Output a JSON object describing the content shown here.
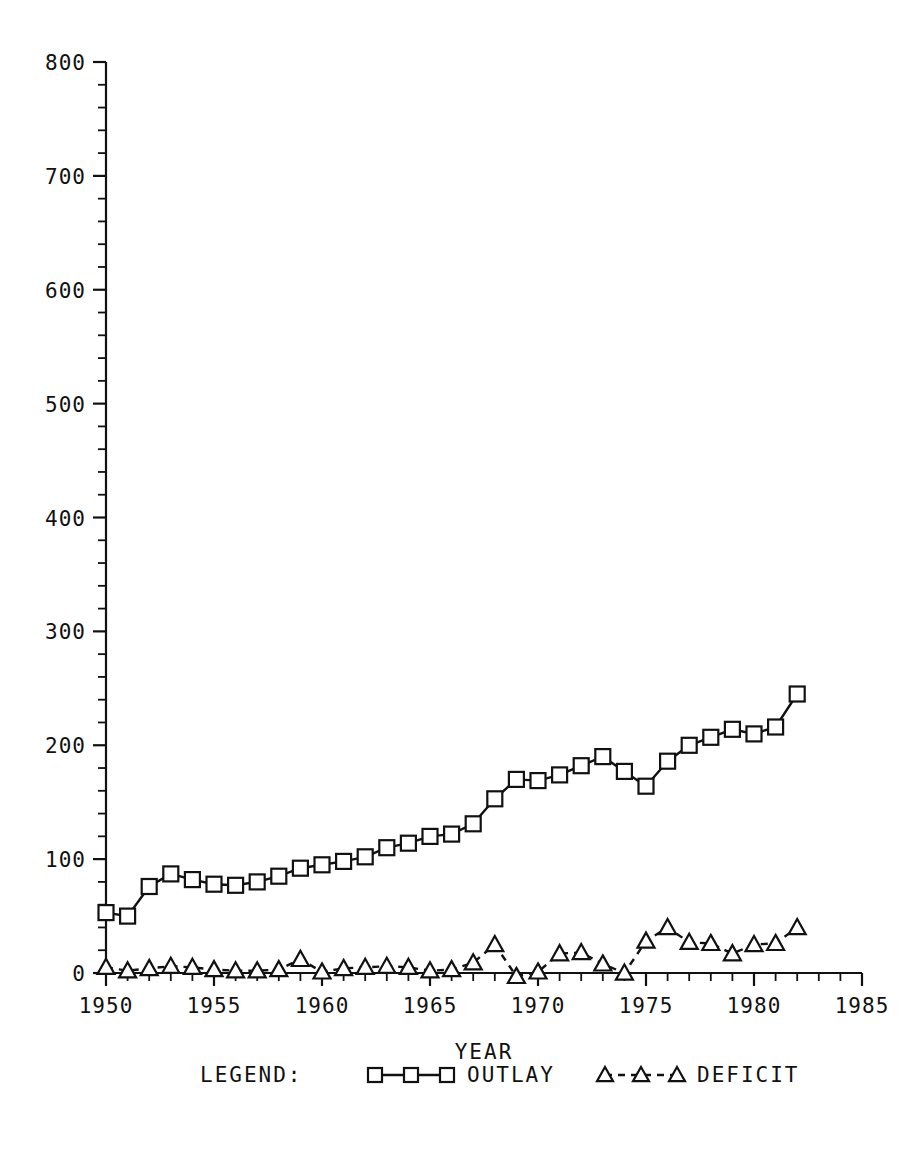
{
  "chart_data": {
    "type": "line",
    "title": "",
    "xlabel": "YEAR",
    "ylabel": "",
    "xlim": [
      1950,
      1985
    ],
    "ylim": [
      0,
      800
    ],
    "grid": false,
    "legend_position": "bottom",
    "legend_label": "LEGEND:",
    "x": [
      1950,
      1951,
      1952,
      1953,
      1954,
      1955,
      1956,
      1957,
      1958,
      1959,
      1960,
      1961,
      1962,
      1963,
      1964,
      1965,
      1966,
      1967,
      1968,
      1969,
      1970,
      1971,
      1972,
      1973,
      1974,
      1975,
      1976,
      1977,
      1978,
      1979,
      1980,
      1981,
      1982
    ],
    "xticks_major": [
      1950,
      1955,
      1960,
      1965,
      1970,
      1975,
      1980,
      1985
    ],
    "xticklabels": [
      "1950",
      "1955",
      "1960",
      "1965",
      "1970",
      "1975",
      "1980",
      "1985"
    ],
    "yticks_major": [
      0,
      100,
      200,
      300,
      400,
      500,
      600,
      700,
      800
    ],
    "yticklabels": [
      "0",
      "100",
      "200",
      "300",
      "400",
      "500",
      "600",
      "700",
      "800"
    ],
    "series": [
      {
        "name": "OUTLAY",
        "marker": "square",
        "linestyle": "solid",
        "color": "#111111",
        "values": [
          53,
          50,
          76,
          87,
          82,
          78,
          77,
          80,
          85,
          92,
          95,
          98,
          102,
          110,
          114,
          120,
          122,
          131,
          153,
          170,
          169,
          174,
          182,
          190,
          177,
          164,
          186,
          200,
          207,
          214,
          210,
          216,
          245
        ]
      },
      {
        "name": "DEFICIT",
        "marker": "triangle",
        "linestyle": "dashed",
        "color": "#111111",
        "values": [
          5,
          2,
          4,
          6,
          5,
          3,
          2,
          2,
          3,
          12,
          1,
          4,
          5,
          6,
          5,
          2,
          3,
          9,
          25,
          -3,
          1,
          17,
          18,
          8,
          0,
          28,
          40,
          27,
          26,
          17,
          25,
          26,
          40
        ]
      }
    ]
  },
  "axis": {
    "x_label": "YEAR",
    "x_tick_labels": [
      "1950",
      "1955",
      "1960",
      "1965",
      "1970",
      "1975",
      "1980",
      "1985"
    ],
    "y_tick_labels": [
      "0",
      "100",
      "200",
      "300",
      "400",
      "500",
      "600",
      "700",
      "800"
    ]
  },
  "legend": {
    "label": "LEGEND:",
    "entries": [
      {
        "name": "OUTLAY",
        "marker": "square-marker",
        "line": "solid"
      },
      {
        "name": "DEFICIT",
        "marker": "triangle-marker",
        "line": "dashed"
      }
    ]
  }
}
